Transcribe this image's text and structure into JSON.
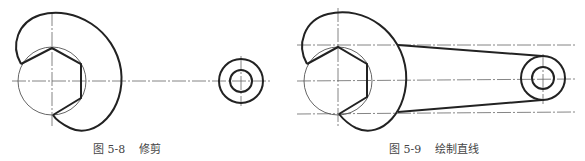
{
  "figures": [
    {
      "id": "fig-5-8",
      "caption": {
        "number": "图 5-8",
        "title": "修剪"
      }
    },
    {
      "id": "fig-5-9",
      "caption": {
        "number": "图 5-9",
        "title": "绘制直线"
      }
    }
  ],
  "colors": {
    "line": "#222222",
    "thin_line": "#555555",
    "centerline": "#666666",
    "background": "#ffffff"
  }
}
